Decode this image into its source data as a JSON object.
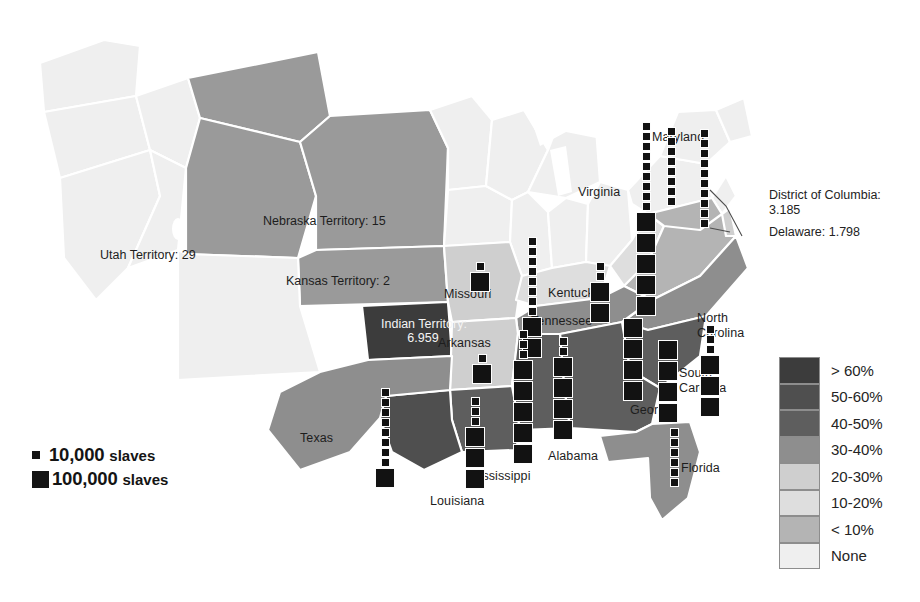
{
  "map": {
    "title": "Distribution of slaves in the United States, 1860",
    "state_labels": [
      {
        "name": "Maryland",
        "x": 652,
        "y": 131,
        "light": false
      },
      {
        "name": "Virginia",
        "x": 578,
        "y": 186,
        "light": false
      },
      {
        "name": "Missouri",
        "x": 444,
        "y": 288,
        "light": false
      },
      {
        "name": "Kentucky",
        "x": 548,
        "y": 287,
        "light": false
      },
      {
        "name": "Tennessee",
        "x": 531,
        "y": 315,
        "light": false
      },
      {
        "name": "Arkansas",
        "x": 438,
        "y": 337,
        "light": false
      },
      {
        "name": "North",
        "x": 697,
        "y": 312,
        "light": false
      },
      {
        "name": "Carolina",
        "x": 697,
        "y": 327,
        "light": false
      },
      {
        "name": "South",
        "x": 679,
        "y": 367,
        "light": false
      },
      {
        "name": "Carolina",
        "x": 679,
        "y": 382,
        "light": false
      },
      {
        "name": "Georgia",
        "x": 630,
        "y": 404,
        "light": false
      },
      {
        "name": "Alabama",
        "x": 548,
        "y": 450,
        "light": false
      },
      {
        "name": "Mississippi",
        "x": 469,
        "y": 470,
        "light": false
      },
      {
        "name": "Louisiana",
        "x": 430,
        "y": 495,
        "light": false
      },
      {
        "name": "Texas",
        "x": 300,
        "y": 432,
        "light": false
      },
      {
        "name": "Florida",
        "x": 681,
        "y": 462,
        "light": false
      }
    ],
    "territory_labels": [
      {
        "name": "Utah Territory: 29",
        "x": 100,
        "y": 248,
        "light": false,
        "w": 150
      },
      {
        "name": "Nebraska Territory: 15",
        "x": 263,
        "y": 214,
        "light": false,
        "w": 190
      },
      {
        "name": "Kansas Territory: 2",
        "x": 286,
        "y": 274,
        "light": false,
        "w": 165
      },
      {
        "name": "Indian Territory:",
        "x": 381,
        "y": 318,
        "light": true,
        "w": 84
      },
      {
        "name": "6.959",
        "x": 381,
        "y": 332,
        "light": true,
        "w": 84
      }
    ],
    "callouts": [
      {
        "lines": [
          "District of Columbia:",
          "3.185"
        ],
        "x": 769,
        "y": 188
      },
      {
        "lines": [
          "Delaware: 1.798"
        ],
        "x": 769,
        "y": 225
      }
    ],
    "dot_stacks": [
      {
        "state": "Maryland",
        "x": 667,
        "y": 127,
        "small": 8,
        "big": 0
      },
      {
        "state": "Virginia",
        "x": 636,
        "y": 122,
        "small": 9,
        "big": 5
      },
      {
        "state": "Delaware",
        "x": 700,
        "y": 129,
        "small": 10,
        "big": 0
      },
      {
        "state": "North Carolina",
        "x": 700,
        "y": 325,
        "small": 3,
        "big": 3
      },
      {
        "state": "South Carolina",
        "x": 658,
        "y": 340,
        "small": 0,
        "big": 4
      },
      {
        "state": "Georgia",
        "x": 623,
        "y": 318,
        "small": 0,
        "big": 4
      },
      {
        "state": "Florida",
        "x": 670,
        "y": 428,
        "small": 6,
        "big": 0
      },
      {
        "state": "Kentucky",
        "x": 590,
        "y": 262,
        "small": 2,
        "big": 2
      },
      {
        "state": "Tennessee",
        "x": 522,
        "y": 237,
        "small": 8,
        "big": 2
      },
      {
        "state": "Alabama",
        "x": 553,
        "y": 337,
        "small": 2,
        "big": 4
      },
      {
        "state": "Mississippi",
        "x": 513,
        "y": 330,
        "small": 3,
        "big": 5
      },
      {
        "state": "Louisiana",
        "x": 465,
        "y": 397,
        "small": 3,
        "big": 3
      },
      {
        "state": "Arkansas",
        "x": 472,
        "y": 354,
        "small": 1,
        "big": 1
      },
      {
        "state": "Missouri",
        "x": 470,
        "y": 262,
        "small": 1,
        "big": 1
      },
      {
        "state": "Texas",
        "x": 375,
        "y": 388,
        "small": 8,
        "big": 1
      }
    ]
  },
  "key": {
    "small": {
      "label_number": "10,000",
      "label_unit": "slaves",
      "size": 8
    },
    "big": {
      "label_number": "100,000",
      "label_unit": "slaves",
      "size": 17
    }
  },
  "legend": {
    "rows": [
      {
        "label": "> 60%",
        "color": "#3c3c3c"
      },
      {
        "label": "50-60%",
        "color": "#4f4f4f"
      },
      {
        "label": "40-50%",
        "color": "#5e5e5e"
      },
      {
        "label": "30-40%",
        "color": "#8e8e8e"
      },
      {
        "label": "20-30%",
        "color": "#cfcfcf"
      },
      {
        "label": "10-20%",
        "color": "#dedede"
      },
      {
        "label": "< 10%",
        "color": "#b4b4b4"
      },
      {
        "label": "None",
        "color": "#efefef"
      }
    ]
  },
  "footer": {
    "text": ""
  },
  "colors": {
    "dot": "#121212",
    "over60": "#3c3c3c",
    "p50_60": "#4f4f4f",
    "p40_50": "#5e5e5e",
    "p30_40": "#8e8e8e",
    "p20_30": "#cfcfcf",
    "p10_20": "#dedede",
    "under10": "#b4b4b4",
    "none": "#efefef",
    "border": "#ffffff"
  }
}
